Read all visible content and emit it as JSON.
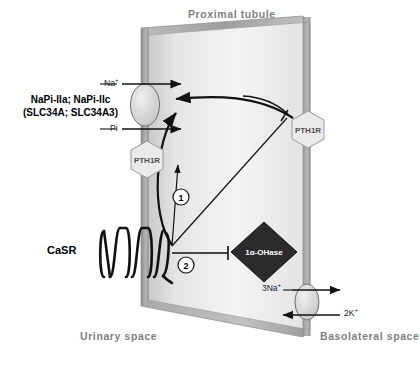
{
  "diagram": {
    "title": "Proximal tubule",
    "compartments": {
      "apical_space": "Urinary space",
      "basolateral_space": "Basolateral  space"
    },
    "cotransporter": {
      "name_line1": "NaPi-IIa; NaPi-IIc",
      "name_line2": "(SLC34A; SLC34A3)",
      "substrate_top": "Na",
      "substrate_top_charge": "+",
      "substrate_bottom": "Pi"
    },
    "receptors": {
      "apical_pth1r": "PTH1R",
      "basolateral_pth1r": "PTH1R",
      "calcium_sensing_receptor": "CaSR"
    },
    "enzyme": {
      "label_prefix": "1",
      "label_alpha": "α",
      "label_suffix": "-OHase"
    },
    "pump": {
      "sodium_out": "3Na",
      "sodium_out_charge": "+",
      "potassium_in": "2K",
      "potassium_in_charge": "+"
    },
    "pathway_markers": {
      "marker_one": "1",
      "marker_two": "2"
    },
    "colors": {
      "cell_face_light": "#f2f2f2",
      "cell_face_dark": "#cfcfcf",
      "membrane_gray": "#a8a8a8",
      "top_edge": "#9a9a9a",
      "enzyme_fill": "#2b2b2b",
      "receptor_fill": "#e8e8e8",
      "line_black": "#111111",
      "space_text": "#7f7f7f"
    }
  }
}
